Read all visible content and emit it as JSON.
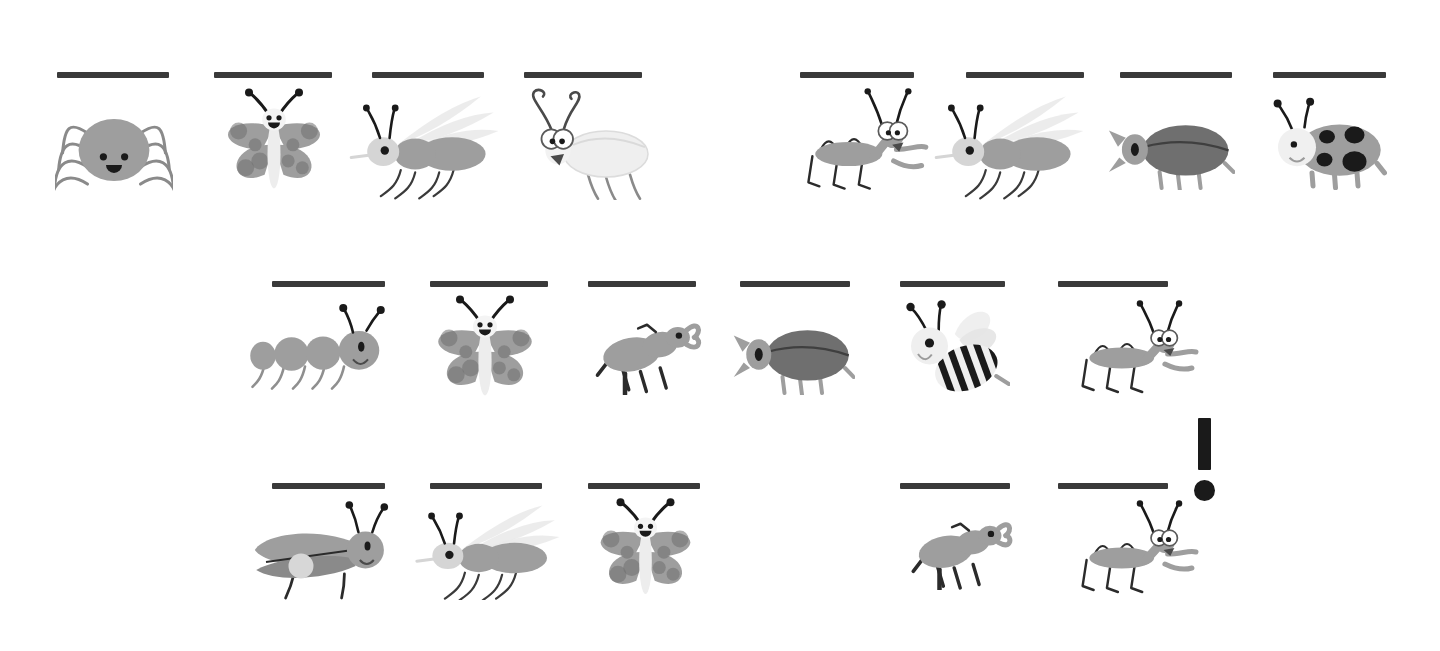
{
  "page": {
    "type": "worksheet",
    "title": "",
    "background_color": "#ffffff",
    "line_color": "#3a3a3a",
    "ink_color": "#1a1a1a",
    "body_gray": "#9e9e9e",
    "dark_gray": "#6f6f6f",
    "light_gray": "#d8d8d8",
    "pale_gray": "#ececec"
  },
  "punctuation": {
    "mark": "!",
    "name": "exclamation-mark"
  },
  "rows": [
    {
      "index": 1,
      "items": [
        {
          "name": "spider",
          "label": "",
          "line": {
            "x": 57,
            "y": 72,
            "w": 112
          },
          "bug": {
            "x": 55,
            "y": 95,
            "w": 118,
            "h": 100
          }
        },
        {
          "name": "butterfly",
          "label": "",
          "line": {
            "x": 214,
            "y": 72,
            "w": 118
          },
          "bug": {
            "x": 215,
            "y": 85,
            "w": 118,
            "h": 115
          }
        },
        {
          "name": "mosquito",
          "label": "",
          "line": {
            "x": 372,
            "y": 72,
            "w": 112
          },
          "bug": {
            "x": 340,
            "y": 85,
            "w": 160,
            "h": 115
          }
        },
        {
          "name": "cricket",
          "label": "",
          "line": {
            "x": 524,
            "y": 72,
            "w": 118
          },
          "bug": {
            "x": 510,
            "y": 85,
            "w": 150,
            "h": 115
          }
        },
        {
          "name": "grasshopper",
          "label": "",
          "line": {
            "x": 800,
            "y": 72,
            "w": 114
          },
          "bug": {
            "x": 790,
            "y": 85,
            "w": 140,
            "h": 115
          }
        },
        {
          "name": "mosquito",
          "label": "",
          "line": {
            "x": 966,
            "y": 72,
            "w": 118
          },
          "bug": {
            "x": 925,
            "y": 85,
            "w": 160,
            "h": 115
          }
        },
        {
          "name": "beetle",
          "label": "",
          "line": {
            "x": 1120,
            "y": 72,
            "w": 112
          },
          "bug": {
            "x": 1105,
            "y": 100,
            "w": 130,
            "h": 90
          }
        },
        {
          "name": "ladybug",
          "label": "",
          "line": {
            "x": 1273,
            "y": 72,
            "w": 113
          },
          "bug": {
            "x": 1262,
            "y": 95,
            "w": 125,
            "h": 95
          }
        }
      ]
    },
    {
      "index": 2,
      "items": [
        {
          "name": "caterpillar",
          "label": "",
          "line": {
            "x": 272,
            "y": 281,
            "w": 113
          },
          "bug": {
            "x": 245,
            "y": 300,
            "w": 150,
            "h": 90
          }
        },
        {
          "name": "butterfly",
          "label": "",
          "line": {
            "x": 430,
            "y": 281,
            "w": 118
          },
          "bug": {
            "x": 425,
            "y": 292,
            "w": 120,
            "h": 115
          }
        },
        {
          "name": "stag-beetle",
          "label": "",
          "line": {
            "x": 588,
            "y": 281,
            "w": 108
          },
          "bug": {
            "x": 592,
            "y": 305,
            "w": 110,
            "h": 90
          }
        },
        {
          "name": "beetle",
          "label": "",
          "line": {
            "x": 740,
            "y": 281,
            "w": 110
          },
          "bug": {
            "x": 730,
            "y": 305,
            "w": 125,
            "h": 90
          }
        },
        {
          "name": "bee",
          "label": "",
          "line": {
            "x": 900,
            "y": 281,
            "w": 105
          },
          "bug": {
            "x": 895,
            "y": 298,
            "w": 115,
            "h": 100
          }
        },
        {
          "name": "grasshopper",
          "label": "",
          "line": {
            "x": 1058,
            "y": 281,
            "w": 110
          },
          "bug": {
            "x": 1065,
            "y": 298,
            "w": 135,
            "h": 100
          }
        }
      ]
    },
    {
      "index": 3,
      "items": [
        {
          "name": "firefly",
          "label": "",
          "line": {
            "x": 272,
            "y": 483,
            "w": 113
          },
          "bug": {
            "x": 252,
            "y": 500,
            "w": 140,
            "h": 100
          }
        },
        {
          "name": "mosquito",
          "label": "",
          "line": {
            "x": 430,
            "y": 483,
            "w": 112
          },
          "bug": {
            "x": 406,
            "y": 495,
            "w": 155,
            "h": 105
          }
        },
        {
          "name": "butterfly",
          "label": "",
          "line": {
            "x": 588,
            "y": 483,
            "w": 112
          },
          "bug": {
            "x": 588,
            "y": 495,
            "w": 115,
            "h": 110
          }
        },
        {
          "name": "stag-beetle",
          "label": "",
          "line": {
            "x": 900,
            "y": 483,
            "w": 110
          },
          "bug": {
            "x": 908,
            "y": 505,
            "w": 105,
            "h": 85
          }
        },
        {
          "name": "grasshopper",
          "label": "",
          "line": {
            "x": 1058,
            "y": 483,
            "w": 110
          },
          "bug": {
            "x": 1065,
            "y": 498,
            "w": 135,
            "h": 100
          }
        }
      ]
    }
  ]
}
